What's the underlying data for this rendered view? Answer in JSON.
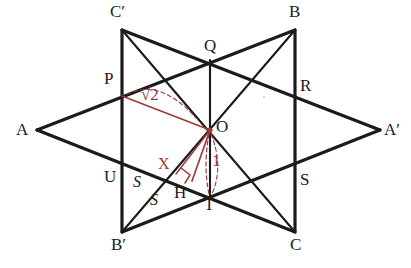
{
  "figure": {
    "kind": "geometry-diagram",
    "colors": {
      "stroke": "#1b1b1b",
      "annotation": "#9c3a3a",
      "background": "#ffffff"
    },
    "vertices": [
      {
        "id": "A",
        "label": "A",
        "x": 37,
        "y": 130,
        "label_x": 16,
        "label_y": 121
      },
      {
        "id": "Ap",
        "label": "A′",
        "x": 380,
        "y": 130,
        "label_x": 384,
        "label_y": 121
      },
      {
        "id": "B",
        "label": "B",
        "x": 295,
        "y": 30,
        "label_x": 289,
        "label_y": 5
      },
      {
        "id": "Bp",
        "label": "B′",
        "x": 122,
        "y": 232,
        "label_x": 112,
        "label_y": 236
      },
      {
        "id": "C",
        "label": "C",
        "x": 295,
        "y": 232,
        "label_x": 290,
        "label_y": 236
      },
      {
        "id": "Cp",
        "label": "C′",
        "x": 122,
        "y": 30,
        "label_x": 112,
        "label_y": 5
      }
    ],
    "points": [
      {
        "id": "P",
        "label": "P",
        "x": 122,
        "y": 96,
        "label_x": 105,
        "label_y": 72
      },
      {
        "id": "Q",
        "label": "Q",
        "x": 210,
        "y": 60,
        "label_x": 204,
        "label_y": 37
      },
      {
        "id": "R",
        "label": "R",
        "x": 295,
        "y": 90,
        "label_x": 300,
        "label_y": 78
      },
      {
        "id": "S",
        "label": "S",
        "x": 295,
        "y": 172,
        "label_x": 300,
        "label_y": 172
      },
      {
        "id": "T",
        "label": "T",
        "x": 210,
        "y": 196,
        "label_x": 205,
        "label_y": 197
      },
      {
        "id": "U",
        "label": "U",
        "x": 122,
        "y": 166,
        "label_x": 105,
        "label_y": 170
      },
      {
        "id": "O",
        "label": "O",
        "x": 210,
        "y": 130,
        "label_x": 216,
        "label_y": 120
      },
      {
        "id": "H",
        "label": "H",
        "x": 192,
        "y": 181,
        "label_x": 176,
        "label_y": 186
      },
      {
        "id": "X",
        "label": "X",
        "x": 178,
        "y": 172,
        "label_x": 160,
        "label_y": 158
      }
    ],
    "side_labels": [
      {
        "id": "s1",
        "label": "S",
        "x": 135,
        "y": 178
      },
      {
        "id": "s2",
        "label": "S",
        "x": 152,
        "y": 196
      }
    ],
    "annotations": [
      {
        "id": "len-sqrt2",
        "label": "√2",
        "value": "√2",
        "x": 146,
        "y": 92,
        "color": "#9c3a3a"
      },
      {
        "id": "len-one",
        "label": "1",
        "value": "1",
        "x": 214,
        "y": 158,
        "color": "#9c3a3a"
      }
    ],
    "segments": [
      {
        "name": "A-B",
        "from": "A",
        "to": "B",
        "style": "solid",
        "weight": "thick"
      },
      {
        "name": "B-C",
        "from": "B",
        "to": "C",
        "style": "solid",
        "weight": "thick"
      },
      {
        "name": "C-A",
        "from": "C",
        "to": "A",
        "style": "solid",
        "weight": "thick"
      },
      {
        "name": "Ap-Bp",
        "from": "Ap",
        "to": "Bp",
        "style": "solid",
        "weight": "thick"
      },
      {
        "name": "Bp-Cp",
        "from": "Bp",
        "to": "Cp",
        "style": "solid",
        "weight": "thick"
      },
      {
        "name": "Cp-Ap",
        "from": "Cp",
        "to": "Ap",
        "style": "solid",
        "weight": "thick"
      },
      {
        "name": "Cp-O-C",
        "from": "Cp",
        "to": "C",
        "style": "solid",
        "weight": "thin"
      },
      {
        "name": "B-O-Bp",
        "from": "B",
        "to": "Bp",
        "style": "solid",
        "weight": "thin"
      },
      {
        "name": "Q-T",
        "from": "Q",
        "to": "T",
        "style": "solid",
        "weight": "thin"
      }
    ],
    "annotation_segments": [
      {
        "name": "P-O",
        "from": "P",
        "to": "O",
        "color": "#9c3a3a",
        "style": "solid"
      },
      {
        "name": "O-H",
        "from": "O",
        "to": "H",
        "color": "#9c3a3a",
        "style": "solid"
      },
      {
        "name": "O-X",
        "from": "O",
        "to": "X",
        "color": "#9c3a3a",
        "style": "solid"
      },
      {
        "name": "O-T-dashed",
        "from": "O",
        "to": "T",
        "color": "#9c3a3a",
        "style": "dashed"
      },
      {
        "name": "P-brace-dashed",
        "from": "P",
        "to": "O",
        "color": "#9c3a3a",
        "style": "dashed"
      }
    ],
    "right_angle_marker": {
      "at": "H",
      "x": 188,
      "y": 173,
      "size": 9
    }
  }
}
